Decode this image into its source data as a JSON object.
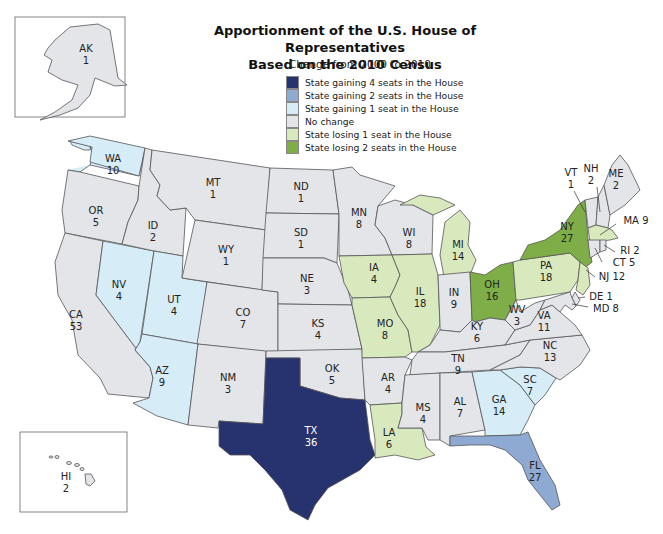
{
  "title_line1": "Apportionment of the U.S. House of Representatives",
  "title_line2": "Based on the 2010 Census",
  "subtitle": "Change from 2000 to 2010",
  "colors": {
    "gain4": "#27336e",
    "gain2": "#8ea9d2",
    "gain1": "#d6ecf7",
    "nochange": "#e3e5e9",
    "lose1": "#d9e9be",
    "lose2": "#7fae48"
  },
  "legend": [
    {
      "key": "gain4",
      "label": "State gaining 4 seats in the House"
    },
    {
      "key": "gain2",
      "label": "State gaining 2 seats in the House"
    },
    {
      "key": "gain1",
      "label": "State gaining 1 seat in the House"
    },
    {
      "key": "nochange",
      "label": "No change"
    },
    {
      "key": "lose1",
      "label": "State losing 1 seat in the House"
    },
    {
      "key": "lose2",
      "label": "State losing 2 seats in the House"
    }
  ],
  "states": {
    "AK": {
      "abbr": "AK",
      "seats": "1",
      "change": "nochange"
    },
    "HI": {
      "abbr": "HI",
      "seats": "2",
      "change": "nochange"
    },
    "WA": {
      "abbr": "WA",
      "seats": "10",
      "change": "gain1"
    },
    "OR": {
      "abbr": "OR",
      "seats": "5",
      "change": "nochange"
    },
    "CA": {
      "abbr": "CA",
      "seats": "53",
      "change": "nochange"
    },
    "ID": {
      "abbr": "ID",
      "seats": "2",
      "change": "nochange"
    },
    "NV": {
      "abbr": "NV",
      "seats": "4",
      "change": "gain1"
    },
    "UT": {
      "abbr": "UT",
      "seats": "4",
      "change": "gain1"
    },
    "AZ": {
      "abbr": "AZ",
      "seats": "9",
      "change": "gain1"
    },
    "MT": {
      "abbr": "MT",
      "seats": "1",
      "change": "nochange"
    },
    "WY": {
      "abbr": "WY",
      "seats": "1",
      "change": "nochange"
    },
    "CO": {
      "abbr": "CO",
      "seats": "7",
      "change": "nochange"
    },
    "NM": {
      "abbr": "NM",
      "seats": "3",
      "change": "nochange"
    },
    "ND": {
      "abbr": "ND",
      "seats": "1",
      "change": "nochange"
    },
    "SD": {
      "abbr": "SD",
      "seats": "1",
      "change": "nochange"
    },
    "NE": {
      "abbr": "NE",
      "seats": "3",
      "change": "nochange"
    },
    "KS": {
      "abbr": "KS",
      "seats": "4",
      "change": "nochange"
    },
    "OK": {
      "abbr": "OK",
      "seats": "5",
      "change": "nochange"
    },
    "TX": {
      "abbr": "TX",
      "seats": "36",
      "change": "gain4"
    },
    "MN": {
      "abbr": "MN",
      "seats": "8",
      "change": "nochange"
    },
    "IA": {
      "abbr": "IA",
      "seats": "4",
      "change": "lose1"
    },
    "MO": {
      "abbr": "MO",
      "seats": "8",
      "change": "lose1"
    },
    "AR": {
      "abbr": "AR",
      "seats": "4",
      "change": "nochange"
    },
    "LA": {
      "abbr": "LA",
      "seats": "6",
      "change": "lose1"
    },
    "WI": {
      "abbr": "WI",
      "seats": "8",
      "change": "nochange"
    },
    "IL": {
      "abbr": "IL",
      "seats": "18",
      "change": "lose1"
    },
    "MI": {
      "abbr": "MI",
      "seats": "14",
      "change": "lose1"
    },
    "IN": {
      "abbr": "IN",
      "seats": "9",
      "change": "nochange"
    },
    "OH": {
      "abbr": "OH",
      "seats": "16",
      "change": "lose2"
    },
    "KY": {
      "abbr": "KY",
      "seats": "6",
      "change": "nochange"
    },
    "TN": {
      "abbr": "TN",
      "seats": "9",
      "change": "nochange"
    },
    "MS": {
      "abbr": "MS",
      "seats": "4",
      "change": "nochange"
    },
    "AL": {
      "abbr": "AL",
      "seats": "7",
      "change": "nochange"
    },
    "GA": {
      "abbr": "GA",
      "seats": "14",
      "change": "gain1"
    },
    "FL": {
      "abbr": "FL",
      "seats": "27",
      "change": "gain2"
    },
    "SC": {
      "abbr": "SC",
      "seats": "7",
      "change": "gain1"
    },
    "NC": {
      "abbr": "NC",
      "seats": "13",
      "change": "nochange"
    },
    "VA": {
      "abbr": "VA",
      "seats": "11",
      "change": "nochange"
    },
    "WV": {
      "abbr": "WV",
      "seats": "3",
      "change": "nochange"
    },
    "PA": {
      "abbr": "PA",
      "seats": "18",
      "change": "lose1"
    },
    "NY": {
      "abbr": "NY",
      "seats": "27",
      "change": "lose2"
    },
    "VT": {
      "abbr": "VT",
      "seats": "1",
      "change": "nochange"
    },
    "NH": {
      "abbr": "NH",
      "seats": "2",
      "change": "nochange"
    },
    "ME": {
      "abbr": "ME",
      "seats": "2",
      "change": "nochange"
    },
    "MA": {
      "abbr": "MA",
      "seats": "9",
      "change": "lose1",
      "label": "MA 9"
    },
    "RI": {
      "abbr": "RI",
      "seats": "2",
      "change": "nochange",
      "label": "RI 2"
    },
    "CT": {
      "abbr": "CT",
      "seats": "5",
      "change": "nochange",
      "label": "CT 5"
    },
    "NJ": {
      "abbr": "NJ",
      "seats": "12",
      "change": "lose1",
      "label": "NJ 12"
    },
    "DE": {
      "abbr": "DE",
      "seats": "1",
      "change": "nochange",
      "label": "DE 1"
    },
    "MD": {
      "abbr": "MD",
      "seats": "8",
      "change": "nochange",
      "label": "MD 8"
    }
  }
}
